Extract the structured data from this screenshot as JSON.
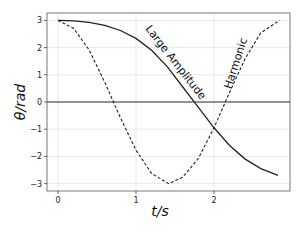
{
  "chart_data": {
    "type": "line",
    "title": "",
    "xlabel": "t/s",
    "ylabel": "θ/rad",
    "xlim": [
      -0.14,
      2.96
    ],
    "ylim": [
      -3.26,
      3.2
    ],
    "xticks": [
      0,
      1,
      2
    ],
    "xtick_labels": [
      "0",
      "1",
      "2"
    ],
    "yticks": [
      -3,
      -2,
      -1,
      0,
      1,
      2,
      3
    ],
    "ytick_labels": [
      "−3",
      "−2",
      "−1",
      "0",
      "1",
      "2",
      "3"
    ],
    "grid": true,
    "legend": "none (inline curve labels)",
    "horizontal_line_at": 0,
    "series": [
      {
        "name": "Large Amplitude",
        "style": "solid",
        "color": "#222222",
        "x": [
          0,
          0.2,
          0.4,
          0.6,
          0.8,
          1.0,
          1.2,
          1.4,
          1.6,
          1.8,
          2.0,
          2.2,
          2.4,
          2.6,
          2.82
        ],
        "y": [
          3.0,
          2.98,
          2.93,
          2.82,
          2.63,
          2.34,
          1.9,
          1.3,
          0.55,
          -0.2,
          -0.95,
          -1.6,
          -2.1,
          -2.45,
          -2.7
        ]
      },
      {
        "name": "Harmonic",
        "style": "dashed",
        "color": "#222222",
        "x": [
          0,
          0.2,
          0.4,
          0.6,
          0.8,
          1.0,
          1.2,
          1.42,
          1.6,
          1.8,
          2.0,
          2.2,
          2.4,
          2.6,
          2.84
        ],
        "y": [
          3.0,
          2.71,
          1.91,
          0.72,
          -0.58,
          -1.77,
          -2.63,
          -3.0,
          -2.76,
          -2.07,
          -0.95,
          0.36,
          1.6,
          2.54,
          3.0
        ]
      }
    ],
    "annotations": [
      {
        "text": "Large Amplitude",
        "x": 1.55,
        "y": 1.3,
        "rotation": 52
      },
      {
        "text": "Harmonic",
        "x": 2.36,
        "y": 1.6,
        "rotation": -72
      }
    ]
  },
  "labels": {
    "xlabel": "t/s",
    "ylabel": "θ/rad",
    "large_amplitude": "Large Amplitude",
    "harmonic": "Harmonic"
  }
}
